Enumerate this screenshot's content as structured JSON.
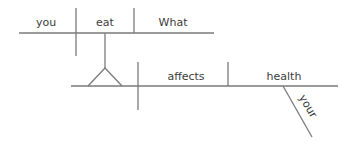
{
  "diagram": {
    "type": "sentence-diagram",
    "sentence": "What you eat affects your health",
    "colors": {
      "line": "#7a7a7a",
      "text": "#3c3c3c",
      "background": "#ffffff"
    },
    "clause": {
      "subject": "you",
      "verb": "eat",
      "object": "What"
    },
    "main": {
      "subject_note": "noun clause (What you eat) on pedestal",
      "verb": "affects",
      "object": "health",
      "modifier": "your"
    }
  }
}
